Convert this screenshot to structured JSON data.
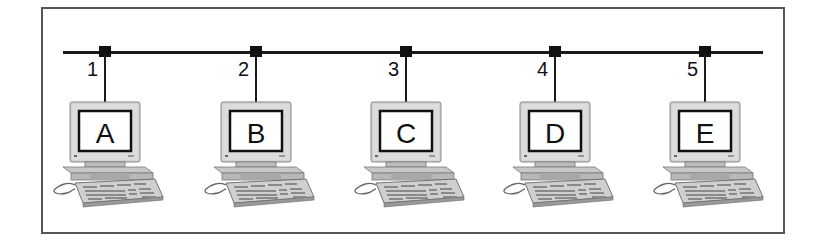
{
  "diagram": {
    "type": "bus-network",
    "bus_line": "shared network bus",
    "nodes": [
      {
        "port": "1",
        "label": "A",
        "x": 105
      },
      {
        "port": "2",
        "label": "B",
        "x": 256
      },
      {
        "port": "3",
        "label": "C",
        "x": 406
      },
      {
        "port": "4",
        "label": "D",
        "x": 555
      },
      {
        "port": "5",
        "label": "E",
        "x": 705
      }
    ]
  },
  "colors": {
    "line": "#1a1a1a",
    "border": "#555555",
    "monitor_case": "#d6d6d6",
    "screen": "#ffffff"
  }
}
